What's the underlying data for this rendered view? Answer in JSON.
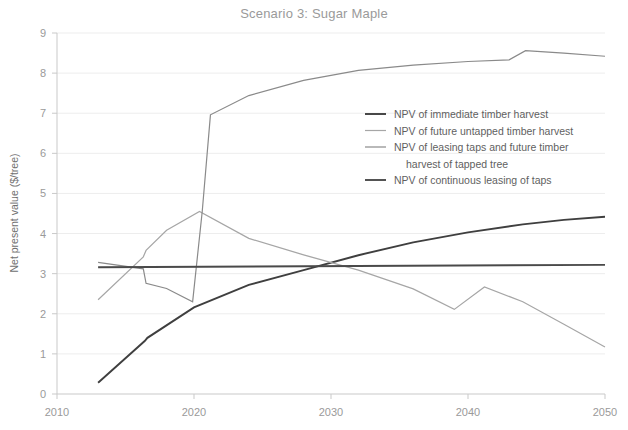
{
  "chart_data": {
    "type": "line",
    "title": "Scenario 3: Sugar Maple",
    "xlabel": "",
    "ylabel": "Net present value ($/tree)",
    "xlim": [
      2010,
      2050
    ],
    "ylim": [
      0,
      9
    ],
    "xticks": [
      2010,
      2020,
      2030,
      2040,
      2050
    ],
    "yticks": [
      0,
      1,
      2,
      3,
      4,
      5,
      6,
      7,
      8,
      9
    ],
    "xtick_labels": [
      "2010",
      "2020",
      "2030",
      "2040",
      "2050"
    ],
    "ytick_labels": [
      "0",
      "1",
      "2",
      "3",
      "4",
      "5",
      "6",
      "7",
      "8",
      "9"
    ],
    "grid": "horizontal",
    "legend_position": "center-right",
    "series": [
      {
        "name": "NPV of immediate timber harvest",
        "color": "#3f3f3f",
        "width": 1.9,
        "points": [
          [
            2013.0,
            0.28
          ],
          [
            2016.4,
            1.32
          ],
          [
            2016.6,
            1.4
          ],
          [
            2020.0,
            2.16
          ],
          [
            2024.0,
            2.72
          ],
          [
            2028.0,
            3.09
          ],
          [
            2032.0,
            3.46
          ],
          [
            2036.0,
            3.78
          ],
          [
            2040.0,
            4.03
          ],
          [
            2044.0,
            4.23
          ],
          [
            2047.0,
            4.34
          ],
          [
            2050.0,
            4.42
          ]
        ]
      },
      {
        "name": "NPV of future untapped timber harvest",
        "color": "#a6a6a6",
        "width": 1.2,
        "points": [
          [
            2013.0,
            2.35
          ],
          [
            2016.3,
            3.42
          ],
          [
            2016.5,
            3.58
          ],
          [
            2018.0,
            4.08
          ],
          [
            2020.4,
            4.55
          ],
          [
            2024.0,
            3.88
          ],
          [
            2028.0,
            3.47
          ],
          [
            2032.0,
            3.09
          ],
          [
            2036.0,
            2.62
          ],
          [
            2039.0,
            2.11
          ],
          [
            2041.2,
            2.67
          ],
          [
            2044.0,
            2.3
          ],
          [
            2047.0,
            1.74
          ],
          [
            2050.0,
            1.17
          ]
        ]
      },
      {
        "name": "NPV of leasing taps and future timber harvest of tapped tree",
        "color": "#8a8a8a",
        "width": 1.2,
        "points": [
          [
            2013.0,
            3.28
          ],
          [
            2016.3,
            3.12
          ],
          [
            2016.5,
            2.76
          ],
          [
            2018.0,
            2.63
          ],
          [
            2019.9,
            2.3
          ],
          [
            2020.6,
            4.55
          ],
          [
            2021.2,
            6.96
          ],
          [
            2024.0,
            7.44
          ],
          [
            2028.0,
            7.82
          ],
          [
            2032.0,
            8.07
          ],
          [
            2036.0,
            8.2
          ],
          [
            2040.0,
            8.29
          ],
          [
            2043.0,
            8.33
          ],
          [
            2044.2,
            8.56
          ],
          [
            2047.0,
            8.5
          ],
          [
            2050.0,
            8.42
          ]
        ]
      },
      {
        "name": "NPV of continuous leasing of taps",
        "color": "#4a4a4a",
        "width": 1.9,
        "points": [
          [
            2013.0,
            3.16
          ],
          [
            2050.0,
            3.22
          ]
        ]
      }
    ],
    "legend": [
      {
        "label": "NPV of immediate timber harvest",
        "color": "#3f3f3f",
        "width": 1.9,
        "swatch": true
      },
      {
        "label": "NPV of future untapped timber harvest",
        "color": "#a6a6a6",
        "width": 1.2,
        "swatch": true
      },
      {
        "label": "NPV of leasing taps and future timber",
        "color": "#8a8a8a",
        "width": 1.2,
        "swatch": true
      },
      {
        "label": "harvest of tapped tree",
        "color": "#8a8a8a",
        "width": 1.2,
        "swatch": false
      },
      {
        "label": "NPV of continuous leasing of taps",
        "color": "#4a4a4a",
        "width": 1.9,
        "swatch": true
      }
    ],
    "colors": {
      "background": "#ffffff",
      "grid": "#ededed",
      "axis": "#c9c9c9",
      "title_text": "#9a9a9a",
      "tick_text": "#9a9a9a",
      "axis_title_text": "#6f6f6f",
      "legend_text": "#5f5f5f"
    }
  }
}
